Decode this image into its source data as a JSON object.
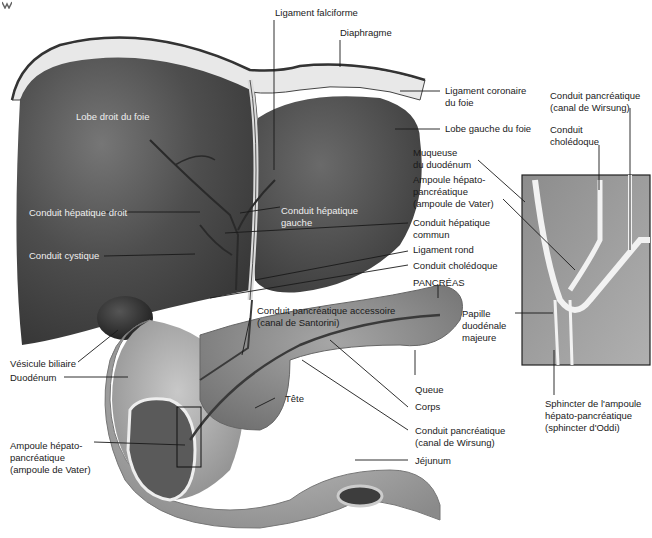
{
  "figure": {
    "corner_icon": "logo-icon",
    "colors": {
      "liver": "#4a4a4a",
      "liver_highlight": "#6e6e6e",
      "diaphragm": "#e8e8e8",
      "gallbladder": "#2e2e2e",
      "duodenum": "#a9a9a9",
      "pancreas": "#8e8e8e",
      "jejunum": "#b4b4b4",
      "inset_bg": "#9a9a9a",
      "leader_line": "#1a1a1a",
      "text": "#1a1a1a",
      "text_on_dark": "#eeeeee"
    }
  },
  "labels": {
    "ligament_falciforme": "Ligament falciforme",
    "diaphragme": "Diaphragme",
    "ligament_coronaire": "Ligament coronaire\ndu foie",
    "lobe_gauche": "Lobe gauche du foie",
    "lobe_droit": "Lobe droit du foie",
    "muqueuse_duodenum": "Muqueuse\ndu duodénum",
    "ampoule_inset": "Ampoule hépato-\npancréatique\n(ampoule de Vater)",
    "conduit_hepatique_droit": "Conduit hépatique droit",
    "conduit_hepatique_gauche": "Conduit hépatique\ngauche",
    "conduit_hepatique_commun": "Conduit hépatique\ncommun",
    "conduit_cystique": "Conduit cystique",
    "ligament_rond": "Ligament rond",
    "conduit_choledoque": "Conduit cholédoque",
    "pancreas": "PANCRÉAS",
    "santorini": "Conduit pancréatique accessoire\n(canal de Santorini)",
    "vesicule_biliaire": "Vésicule biliaire",
    "duodenum": "Duodénum",
    "tete": "Tête",
    "queue": "Queue",
    "corps": "Corps",
    "wirsung_main": "Conduit pancréatique\n(canal de Wirsung)",
    "jejunum": "Jéjunum",
    "ampoule_main": "Ampoule hépato-\npancréatique\n(ampoule de Vater)",
    "inset_wirsung": "Conduit pancréatique\n(canal de Wirsung)",
    "inset_choledoque": "Conduit\ncholédoque",
    "papille": "Papille\nduodénale\nmajeure",
    "sphincter": "Sphincter de l'ampoule\nhépato-pancréatique\n(sphincter d'Oddi)"
  }
}
